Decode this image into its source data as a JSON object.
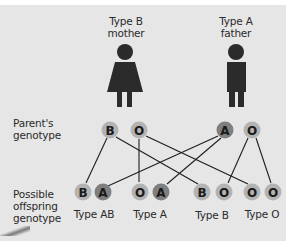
{
  "parents": {
    "mother": {
      "label_line1": "Type B",
      "label_line2": "mother",
      "alleles": [
        "B",
        "O"
      ]
    },
    "father": {
      "label_line1": "Type A",
      "label_line2": "father",
      "alleles": [
        "A",
        "O"
      ]
    }
  },
  "row_labels": {
    "parent_line1": "Parent's",
    "parent_line2": "genotype",
    "offspring_line1": "Possible",
    "offspring_line2": "offspring",
    "offspring_line3": "genotype"
  },
  "offspring": [
    {
      "alleles": [
        "B",
        "A"
      ],
      "type_label": "Type AB"
    },
    {
      "alleles": [
        "O",
        "A"
      ],
      "type_label": "Type A"
    },
    {
      "alleles": [
        "B",
        "O"
      ],
      "type_label": "Type B"
    },
    {
      "alleles": [
        "O",
        "O"
      ],
      "type_label": "Type O"
    }
  ],
  "colors": {
    "background": "#e6e6e6",
    "allele_light": "#b3b3b3",
    "allele_dark": "#7f7f7f",
    "figure": "#2b2b2b",
    "line": "#1e1e1e"
  }
}
